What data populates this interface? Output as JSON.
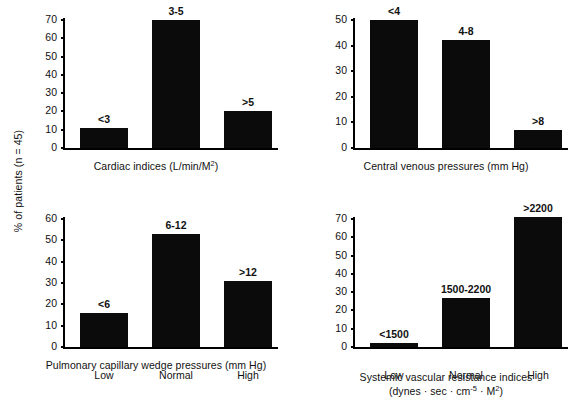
{
  "figure": {
    "y_axis_label": "% of patients (n = 45)",
    "bar_color": "#0b0b0b",
    "background": "#ffffff"
  },
  "chart_data": [
    {
      "id": "cardiac-indices",
      "type": "bar",
      "title": "",
      "caption_line1": "Cardiac indices (L/min/M",
      "caption_sup": "2",
      "caption_line1_end": ")",
      "caption_full": "Cardiac indices (L/min/M2)",
      "xlabel": "",
      "ylabel": "% of patients (n = 45)",
      "ylim": [
        0,
        70
      ],
      "yticks": [
        0,
        10,
        20,
        30,
        40,
        50,
        60,
        70
      ],
      "grid": false,
      "legend": "none",
      "categories": [
        "Low",
        "Normal",
        "High"
      ],
      "show_category_labels": false,
      "bar_labels": [
        "<3",
        "3-5",
        ">5"
      ],
      "values": [
        11,
        70,
        20
      ]
    },
    {
      "id": "central-venous-pressures",
      "type": "bar",
      "title": "",
      "caption_full": "Central venous pressures (mm Hg)",
      "xlabel": "",
      "ylabel": "% of patients (n = 45)",
      "ylim": [
        0,
        50
      ],
      "yticks": [
        0,
        10,
        20,
        30,
        40,
        50
      ],
      "grid": false,
      "legend": "none",
      "categories": [
        "Low",
        "Normal",
        "High"
      ],
      "show_category_labels": false,
      "bar_labels": [
        "<4",
        "4-8",
        ">8"
      ],
      "values": [
        50,
        42,
        7
      ]
    },
    {
      "id": "pulmonary-capillary-wedge-pressures",
      "type": "bar",
      "title": "",
      "caption_full": "Pulmonary capillary wedge pressures (mm Hg)",
      "xlabel": "",
      "ylabel": "% of patients (n = 45)",
      "ylim": [
        0,
        60
      ],
      "yticks": [
        0,
        10,
        20,
        30,
        40,
        50,
        60
      ],
      "grid": false,
      "legend": "none",
      "categories": [
        "Low",
        "Normal",
        "High"
      ],
      "show_category_labels": true,
      "bar_labels": [
        "<6",
        "6-12",
        ">12"
      ],
      "values": [
        16,
        53,
        31
      ]
    },
    {
      "id": "systemic-vascular-resistance-indices",
      "type": "bar",
      "title": "",
      "caption_line1": "Systemic vascular resistance indices",
      "caption_line2_a": "(dynes · sec · cm",
      "caption_line2_sup1": "-5",
      "caption_line2_b": " · M",
      "caption_line2_sup2": "2",
      "caption_line2_c": ")",
      "caption_full": "Systemic vascular resistance indices (dynes · sec · cm-5 · M2)",
      "xlabel": "",
      "ylabel": "% of patients (n = 45)",
      "ylim": [
        0,
        70
      ],
      "yticks": [
        0,
        10,
        20,
        30,
        40,
        50,
        60,
        70
      ],
      "grid": false,
      "legend": "none",
      "categories": [
        "Low",
        "Normal",
        "High"
      ],
      "show_category_labels": true,
      "bar_labels": [
        "<1500",
        "1500-2200",
        ">2200"
      ],
      "values": [
        2,
        27,
        71
      ]
    }
  ]
}
